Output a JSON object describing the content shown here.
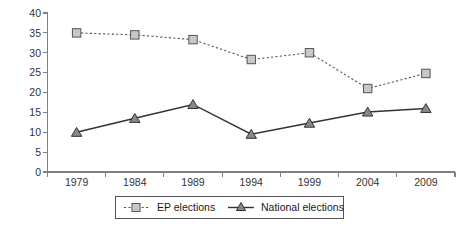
{
  "chart_data": {
    "type": "line",
    "title": "",
    "subtitle": "",
    "xlabel": "",
    "ylabel": "",
    "categories": [
      "1979",
      "1984",
      "1989",
      "1994",
      "1999",
      "2004",
      "2009"
    ],
    "series": [
      {
        "name": "EP elections",
        "values": [
          35,
          34.5,
          33.3,
          28.3,
          30,
          21,
          24.8
        ],
        "line_style": "dotted",
        "marker": "square",
        "color": "#555555",
        "marker_fill": "#c8c8c8"
      },
      {
        "name": "National elections",
        "values": [
          10,
          13.5,
          17,
          9.5,
          12.3,
          15.1,
          16
        ],
        "line_style": "solid",
        "marker": "triangle",
        "color": "#333333",
        "marker_fill": "#888888"
      }
    ],
    "ylim": [
      0,
      40
    ],
    "yticks": [
      0,
      5,
      10,
      15,
      20,
      25,
      30,
      35,
      40
    ],
    "ytick_labels": [
      "0",
      "5",
      "10",
      "15",
      "20",
      "25",
      "30",
      "35",
      "40"
    ],
    "xtick_labels": [
      "1979",
      "1984",
      "1989",
      "1994",
      "1999",
      "2004",
      "2009"
    ],
    "grid": false,
    "legend_position": "bottom-center"
  },
  "axis": {
    "y_labels": [
      "40",
      "35",
      "30",
      "25",
      "20",
      "15",
      "10",
      "5",
      "0"
    ],
    "x_labels": [
      "1979",
      "1984",
      "1989",
      "1994",
      "1999",
      "2004",
      "2009"
    ]
  },
  "legend": {
    "entries": [
      {
        "label": "EP elections",
        "marker": "square-marker"
      },
      {
        "label": "National elections",
        "marker": "triangle-marker"
      }
    ]
  },
  "colors": {
    "axis": "#808080",
    "ep_line": "#555555",
    "ep_marker_fill": "#c8c8c8",
    "national_line": "#333333",
    "national_marker_fill": "#888888",
    "legend_border": "#555555",
    "background": "#ffffff"
  }
}
